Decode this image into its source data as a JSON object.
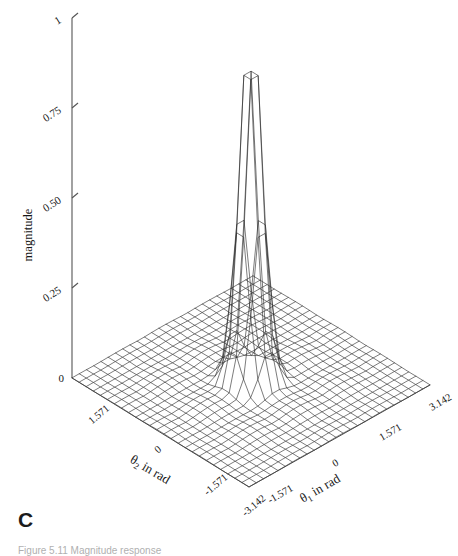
{
  "figure": {
    "panel_label": "C",
    "caption": "Figure 5.11 Magnitude response",
    "background_color": "#ffffff",
    "line_color": "#2b2b2b",
    "axis_color": "#4a4a4a"
  },
  "chart_data": {
    "type": "line",
    "render": "surface-mesh-3d",
    "title": "",
    "subtitle": "",
    "zlabel": "magnitude",
    "xlabel": "θ1 in rad",
    "ylabel": "θ2 in rad",
    "grid": true,
    "legend": null,
    "zlim": [
      0,
      1
    ],
    "xlim": [
      -3.142,
      3.142
    ],
    "ylim": [
      -3.142,
      3.142
    ],
    "zticks": [
      "0",
      "0.25",
      "0.50",
      "0.75",
      "1"
    ],
    "ztick_values": [
      0,
      0.25,
      0.5,
      0.75,
      1
    ],
    "xticks": [
      "-1.571",
      "0",
      "1.571",
      "3.142"
    ],
    "xtick_values": [
      -1.571,
      0,
      1.571,
      3.142
    ],
    "yticks": [
      "1.571",
      "0",
      "-1.571",
      "-3.142"
    ],
    "ytick_values": [
      1.571,
      0,
      -1.571,
      -3.142
    ],
    "front_corner_label": "-3.142",
    "surface": {
      "description": "Sharp narrow 2-D peak centred at (0,0) reaching magnitude 1, decaying to near 0 at the plot edges",
      "peak_value": 1,
      "peak_x": 0,
      "peak_y": 0,
      "grid_n": 25,
      "sigma": 0.3,
      "floor_ripple": 0.012
    }
  }
}
